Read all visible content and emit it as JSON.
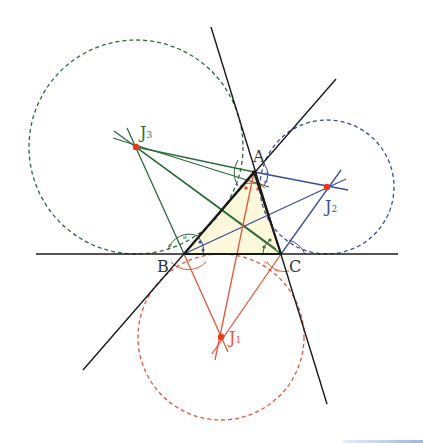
{
  "diagram": {
    "colors": {
      "triangle_fill": "#fbf8dc",
      "side_lines": "#1a1a1a",
      "j1": "#e8553a",
      "j2": "#3a4f9a",
      "j3": "#2f6a3a",
      "center_dot": "#e53a1f"
    },
    "vertices": {
      "A": {
        "label": "A",
        "x": 254,
        "y": 172
      },
      "B": {
        "label": "B",
        "x": 184,
        "y": 254
      },
      "C": {
        "label": "C",
        "x": 281,
        "y": 254
      }
    },
    "excenters": {
      "J1": {
        "label": "J",
        "sub": "1",
        "x": 221,
        "y": 337,
        "r": 83,
        "color": "#e8553a"
      },
      "J2": {
        "label": "J",
        "sub": "2",
        "x": 327,
        "y": 187,
        "r": 67,
        "color": "#3a4f9a"
      },
      "J3": {
        "label": "J",
        "sub": "3",
        "x": 136,
        "y": 147,
        "r": 107,
        "color": "#2f6a3a"
      }
    },
    "lines": {
      "BC": {
        "x1": 36,
        "y1": 254,
        "x2": 398,
        "y2": 254
      },
      "AC": {
        "x1": 211,
        "y1": 27,
        "x2": 327,
        "y2": 404
      },
      "AB": {
        "x1": 336,
        "y1": 79,
        "x2": 83,
        "y2": 370
      }
    }
  }
}
